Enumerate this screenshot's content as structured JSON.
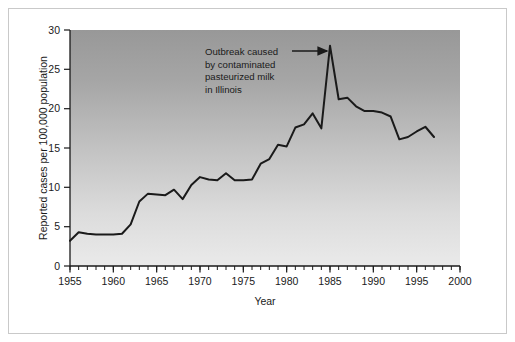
{
  "figure": {
    "background_color": "#ffffff",
    "frame_color": "#c9c9c9",
    "plot_gradient_top": "#9a9a9a",
    "plot_gradient_bottom": "#e9e9e9",
    "line_color": "#1a1a1a",
    "axis_color": "#1a1a1a"
  },
  "annotation": {
    "line1": "Outbreak caused",
    "line2": "by contaminated",
    "line3": "pasteurized milk",
    "line4": "in Illinois",
    "arrow_name": "annotation-arrow"
  },
  "axis": {
    "x_title": "Year",
    "y_title": "Reported cases per 100,000 population",
    "x_tick_labels": [
      "1955",
      "1960",
      "1965",
      "1970",
      "1975",
      "1980",
      "1985",
      "1990",
      "1995",
      "2000"
    ],
    "y_tick_labels": [
      "0",
      "5",
      "10",
      "15",
      "20",
      "25",
      "30"
    ]
  },
  "chart_data": {
    "type": "line",
    "title": "",
    "subtitle": "",
    "xlabel": "Year",
    "ylabel": "Reported cases per 100,000 population",
    "xlim": [
      1955,
      2000
    ],
    "ylim": [
      0,
      30
    ],
    "xticks": [
      1955,
      1960,
      1965,
      1970,
      1975,
      1980,
      1985,
      1990,
      1995,
      2000
    ],
    "yticks": [
      0,
      5,
      10,
      15,
      20,
      25,
      30
    ],
    "x_minor_tick_interval": 1,
    "grid": false,
    "legend": "none",
    "annotations": [
      {
        "text": "Outbreak caused by contaminated pasteurized milk in Illinois",
        "points_to_x": 1985,
        "points_to_y": 28.0
      }
    ],
    "x": [
      1955,
      1956,
      1957,
      1958,
      1959,
      1960,
      1961,
      1962,
      1963,
      1964,
      1965,
      1966,
      1967,
      1968,
      1969,
      1970,
      1971,
      1972,
      1973,
      1974,
      1975,
      1976,
      1977,
      1978,
      1979,
      1980,
      1981,
      1982,
      1983,
      1984,
      1985,
      1986,
      1987,
      1988,
      1989,
      1990,
      1991,
      1992,
      1993,
      1994,
      1995,
      1996,
      1997
    ],
    "values": [
      3.2,
      4.3,
      4.1,
      4.0,
      4.0,
      4.0,
      4.1,
      5.3,
      8.2,
      9.2,
      9.1,
      9.0,
      9.7,
      8.5,
      10.3,
      11.3,
      11.0,
      10.9,
      11.8,
      10.9,
      10.9,
      11.0,
      13.0,
      13.6,
      15.4,
      15.2,
      17.6,
      18.0,
      19.4,
      17.5,
      28.0,
      21.2,
      21.4,
      20.3,
      19.7,
      19.7,
      19.5,
      19.0,
      16.1,
      16.4,
      17.1,
      17.7,
      16.4
    ],
    "series": [
      {
        "name": "Reported cases per 100,000 population",
        "values": [
          3.2,
          4.3,
          4.1,
          4.0,
          4.0,
          4.0,
          4.1,
          5.3,
          8.2,
          9.2,
          9.1,
          9.0,
          9.7,
          8.5,
          10.3,
          11.3,
          11.0,
          10.9,
          11.8,
          10.9,
          10.9,
          11.0,
          13.0,
          13.6,
          15.4,
          15.2,
          17.6,
          18.0,
          19.4,
          17.5,
          28.0,
          21.2,
          21.4,
          20.3,
          19.7,
          19.7,
          19.5,
          19.0,
          16.1,
          16.4,
          17.1,
          17.7,
          16.4
        ]
      }
    ]
  }
}
